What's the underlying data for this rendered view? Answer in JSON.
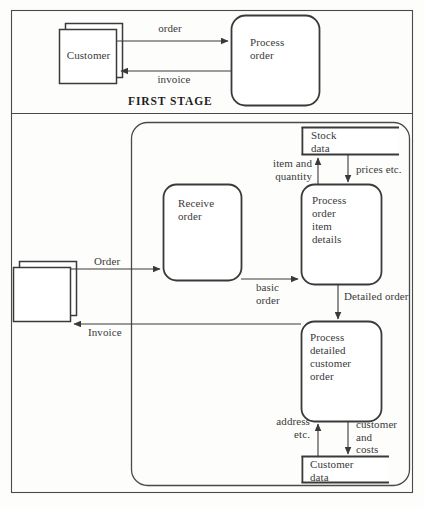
{
  "figure": {
    "background_color": "#fdfdfc",
    "line_color": "#3a3a3a",
    "text_color": "#3a3a3a"
  },
  "stage_labels": {
    "first_stage": "FIRST STAGE"
  },
  "first_stage": {
    "entity_customer": "Customer",
    "process_order": "Process\norder",
    "flows": {
      "order": "order",
      "invoice": "invoice"
    }
  },
  "second_stage": {
    "entity_customer": "",
    "processes": {
      "receive_order": "Receive\norder",
      "process_order_item_details": "Process\norder\nitem\ndetails",
      "process_detailed_customer_order": "Process\ndetailed\ncustomer\norder"
    },
    "data_stores": {
      "stock_data": "Stock\ndata",
      "customer_data": "Customer\ndata"
    },
    "flows": {
      "order_in": "Order",
      "invoice_out": "Invoice",
      "basic_order": "basic\norder",
      "item_and_quantity": "item and\nquantity",
      "prices_etc": "prices etc.",
      "detailed_order": "Detailed order",
      "address_etc": "address\netc.",
      "customer_and_costs": "customer\nand\ncosts"
    }
  }
}
